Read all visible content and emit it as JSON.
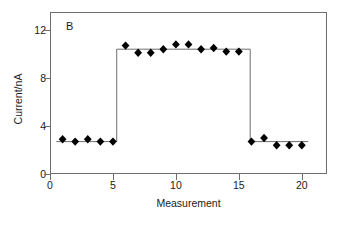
{
  "chart_data": {
    "type": "scatter",
    "title": "",
    "panel_label": "B",
    "xlabel": "Measurement",
    "ylabel": "Current/nA",
    "xlim": [
      0,
      22
    ],
    "ylim": [
      0,
      13.5
    ],
    "xticks": [
      0,
      5,
      10,
      15,
      20
    ],
    "yticks": [
      0,
      4,
      8,
      12
    ],
    "xtick_labels": [
      "0",
      "5",
      "10",
      "15",
      "20"
    ],
    "ytick_labels": [
      "0",
      "4",
      "8",
      "12"
    ],
    "grid": false,
    "legend": null,
    "marker": "filled-diamond",
    "marker_color": "#000000",
    "line_color": "#6e6e6e",
    "axis_color": "#6e6e6e",
    "x": [
      1,
      2,
      3,
      4,
      5,
      6,
      7,
      8,
      9,
      10,
      11,
      12,
      13,
      14,
      15,
      16,
      17,
      18,
      19,
      20
    ],
    "values": [
      2.9,
      2.7,
      2.9,
      2.7,
      2.7,
      10.7,
      10.1,
      10.1,
      10.4,
      10.8,
      10.8,
      10.4,
      10.5,
      10.2,
      10.2,
      2.7,
      3.0,
      2.4,
      2.4,
      2.4
    ],
    "step_line": {
      "description": "square-wave step trace overlaying the points",
      "segments": [
        {
          "x_start": 0.5,
          "x_end": 5.3,
          "y": 2.7
        },
        {
          "x_start": 5.3,
          "x_end": 15.9,
          "y": 10.4
        },
        {
          "x_start": 15.9,
          "x_end": 20.5,
          "y": 2.7
        }
      ],
      "low_level": 2.7,
      "high_level": 10.4
    }
  }
}
